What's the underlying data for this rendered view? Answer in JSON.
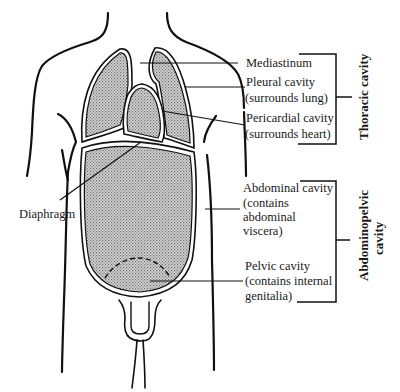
{
  "diagram": {
    "labels": {
      "mediastinum": "Mediastinum",
      "pleural_line1": "Pleural cavity",
      "pleural_line2": "(surrounds lung)",
      "pericardial_line1": "Pericardial cavity",
      "pericardial_line2": "(surrounds heart)",
      "diaphragm": "Diaphragm",
      "abdominal_line1": "Abdominal cavity",
      "abdominal_line2": "(contains",
      "abdominal_line3": "abdominal",
      "abdominal_line4": "viscera)",
      "pelvic_line1": "Pelvic cavity",
      "pelvic_line2": "(contains internal",
      "pelvic_line3": "genitalia)"
    },
    "groups": {
      "thoracic": "Thoracic cavity",
      "abdominopelvic_line1": "Abdominopelvic",
      "abdominopelvic_line2": "cavity"
    },
    "colors": {
      "line": "#111111",
      "fill_stipple": "#bdbdbd",
      "background": "#ffffff"
    }
  }
}
